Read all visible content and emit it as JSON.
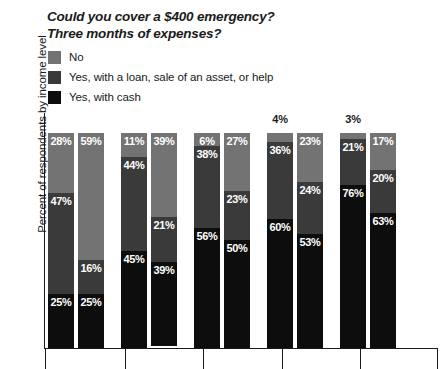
{
  "title": {
    "line1": "Could you cover a $400 emergency?",
    "line2": "Three months of expenses?"
  },
  "legend": {
    "items": [
      {
        "label": "No",
        "color": "#737373",
        "key": "no"
      },
      {
        "label": "Yes, with a loan, sale of an asset, or help",
        "color": "#3a3a3a",
        "key": "loan"
      },
      {
        "label": "Yes, with cash",
        "color": "#0d0d0d",
        "key": "cash"
      }
    ]
  },
  "axes": {
    "ylabel": "Percent of respondents by income level"
  },
  "colors": {
    "no": "#737373",
    "loan": "#3a3a3a",
    "cash": "#0d0d0d",
    "text": "#1a1a1a",
    "label_on_bar": "#ffffff",
    "background": "#ffffff"
  },
  "chart_data": {
    "type": "bar",
    "subtype": "stacked-column",
    "title": "Could you cover a $400 emergency? Three months of expenses?",
    "xlabel": "",
    "ylabel": "Percent of respondents by income level",
    "ylim": [
      0,
      100
    ],
    "grid": false,
    "legend_position": "top-left",
    "stack_order_top_to_bottom": [
      "No",
      "Yes, with a loan, sale of an asset, or help",
      "Yes, with cash"
    ],
    "series": [
      {
        "name": "No",
        "values": [
          28,
          59,
          11,
          39,
          6,
          27,
          4,
          23,
          3,
          17
        ]
      },
      {
        "name": "Yes, with a loan, sale of an asset, or help",
        "values": [
          47,
          16,
          44,
          21,
          38,
          23,
          36,
          24,
          21,
          20
        ]
      },
      {
        "name": "Yes, with cash",
        "values": [
          25,
          25,
          45,
          39,
          56,
          50,
          60,
          53,
          76,
          63
        ]
      }
    ],
    "bars": [
      {
        "index": 1,
        "group": 1,
        "question": "$400 emergency",
        "no": 28,
        "loan": 47,
        "cash": 25,
        "no_label_outside": false
      },
      {
        "index": 2,
        "group": 1,
        "question": "3 months expenses",
        "no": 59,
        "loan": 16,
        "cash": 25,
        "no_label_outside": false
      },
      {
        "index": 3,
        "group": 2,
        "question": "$400 emergency",
        "no": 11,
        "loan": 44,
        "cash": 45,
        "no_label_outside": false
      },
      {
        "index": 4,
        "group": 2,
        "question": "3 months expenses",
        "no": 39,
        "loan": 21,
        "cash": 39,
        "no_label_outside": false
      },
      {
        "index": 5,
        "group": 3,
        "question": "$400 emergency",
        "no": 6,
        "loan": 38,
        "cash": 56,
        "no_label_outside": false
      },
      {
        "index": 6,
        "group": 3,
        "question": "3 months expenses",
        "no": 27,
        "loan": 23,
        "cash": 50,
        "no_label_outside": false
      },
      {
        "index": 7,
        "group": 4,
        "question": "$400 emergency",
        "no": 4,
        "loan": 36,
        "cash": 60,
        "no_label_outside": true
      },
      {
        "index": 8,
        "group": 4,
        "question": "3 months expenses",
        "no": 23,
        "loan": 24,
        "cash": 53,
        "no_label_outside": false
      },
      {
        "index": 9,
        "group": 5,
        "question": "$400 emergency",
        "no": 3,
        "loan": 21,
        "cash": 76,
        "no_label_outside": true
      },
      {
        "index": 10,
        "group": 5,
        "question": "3 months expenses",
        "no": 17,
        "loan": 20,
        "cash": 63,
        "no_label_outside": false
      }
    ],
    "bar_labels": [
      [
        "28%",
        "47%",
        "25%"
      ],
      [
        "59%",
        "16%",
        "25%"
      ],
      [
        "11%",
        "44%",
        "45%"
      ],
      [
        "39%",
        "21%",
        "39%"
      ],
      [
        "6%",
        "38%",
        "56%"
      ],
      [
        "27%",
        "23%",
        "50%"
      ],
      [
        "4%",
        "36%",
        "60%"
      ],
      [
        "23%",
        "24%",
        "53%"
      ],
      [
        "3%",
        "21%",
        "76%"
      ],
      [
        "17%",
        "20%",
        "63%"
      ]
    ]
  }
}
